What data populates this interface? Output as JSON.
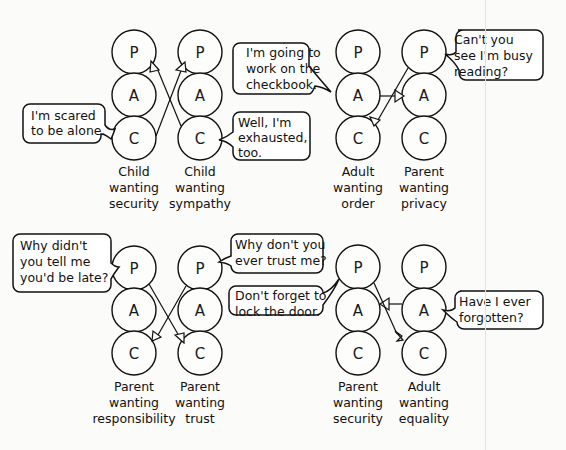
{
  "diagram": {
    "ego_states": [
      "P",
      "A",
      "C"
    ],
    "panels": [
      {
        "id": "top-left",
        "left_person": {
          "label_lines": [
            "Child",
            "wanting",
            "security"
          ]
        },
        "right_person": {
          "label_lines": [
            "Child",
            "wanting",
            "sympathy"
          ]
        },
        "left_bubble": {
          "lines": [
            "I'm scared",
            "to be alone."
          ],
          "from": "C"
        },
        "right_bubble": {
          "lines": [
            "Well, I'm",
            "exhausted,",
            "too."
          ],
          "from": "C"
        },
        "transactions": [
          {
            "from": "left.C",
            "to": "right.P"
          },
          {
            "from": "right.C",
            "to": "left.P"
          }
        ]
      },
      {
        "id": "top-right",
        "left_person": {
          "label_lines": [
            "Adult",
            "wanting",
            "order"
          ]
        },
        "right_person": {
          "label_lines": [
            "Parent",
            "wanting",
            "privacy"
          ]
        },
        "left_bubble": {
          "lines": [
            "I'm going to",
            "work on the",
            "checkbook."
          ],
          "from": "A"
        },
        "right_bubble": {
          "lines": [
            "Can't you",
            "see I'm busy",
            "reading?"
          ],
          "from": "P"
        },
        "transactions": [
          {
            "from": "left.A",
            "to": "right.A"
          },
          {
            "from": "right.P",
            "to": "left.C"
          }
        ]
      },
      {
        "id": "bottom-left",
        "left_person": {
          "label_lines": [
            "Parent",
            "wanting",
            "responsibility"
          ]
        },
        "right_person": {
          "label_lines": [
            "Parent",
            "wanting",
            "trust"
          ]
        },
        "left_bubble": {
          "lines": [
            "Why didn't",
            "you tell me",
            "you'd be late?"
          ],
          "from": "P"
        },
        "right_bubble": {
          "lines": [
            "Why don't you",
            "ever trust me?"
          ],
          "from": "P"
        },
        "transactions": [
          {
            "from": "left.P",
            "to": "right.C"
          },
          {
            "from": "right.P",
            "to": "left.C"
          }
        ]
      },
      {
        "id": "bottom-right",
        "left_person": {
          "label_lines": [
            "Parent",
            "wanting",
            "security"
          ]
        },
        "right_person": {
          "label_lines": [
            "Adult",
            "wanting",
            "equality"
          ]
        },
        "left_bubble": {
          "lines": [
            "Don't forget to",
            "lock the door."
          ],
          "from": "P"
        },
        "right_bubble": {
          "lines": [
            "Have I ever",
            "forgotten?"
          ],
          "from": "A"
        },
        "transactions": [
          {
            "from": "left.P",
            "to": "right.C"
          },
          {
            "from": "right.A",
            "to": "left.A"
          }
        ]
      }
    ]
  }
}
